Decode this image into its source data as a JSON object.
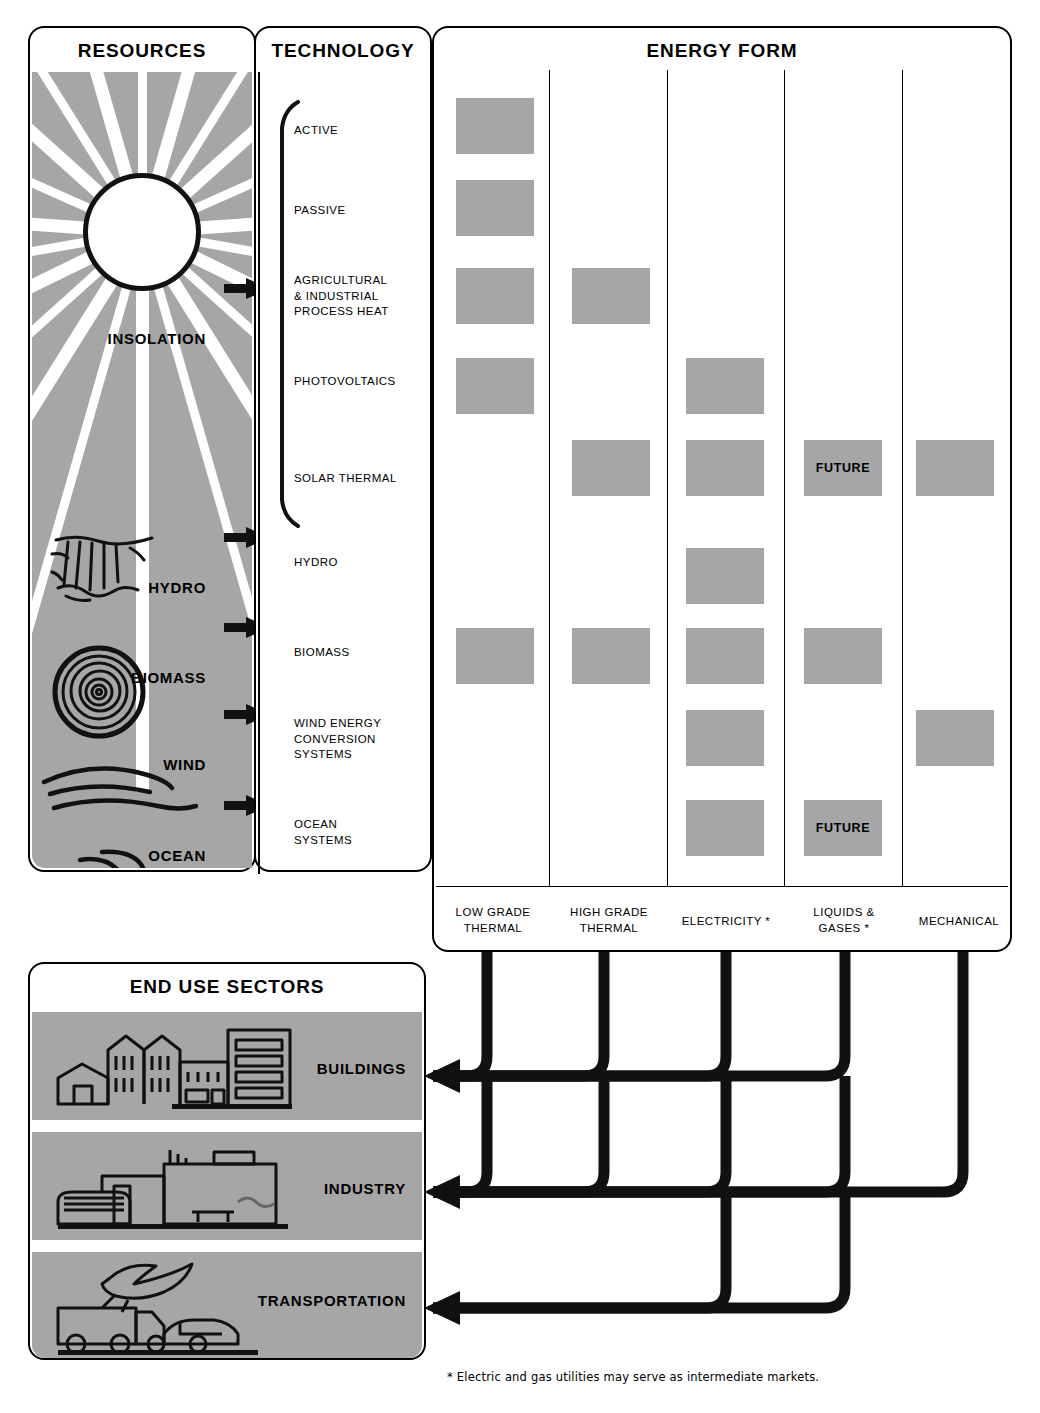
{
  "resources": {
    "title": "RESOURCES",
    "items": [
      {
        "label": "INSOLATION",
        "icon": "sun-icon"
      },
      {
        "label": "HYDRO",
        "icon": "waterfall-icon"
      },
      {
        "label": "BIOMASS",
        "icon": "log-cross-section-icon"
      },
      {
        "label": "WIND",
        "icon": "wind-lines-icon"
      },
      {
        "label": "OCEAN",
        "icon": "ocean-wave-icon"
      }
    ]
  },
  "technology": {
    "title": "TECHNOLOGY",
    "items": [
      {
        "label": "ACTIVE"
      },
      {
        "label": "PASSIVE"
      },
      {
        "label": "AGRICULTURAL\n& INDUSTRIAL\nPROCESS HEAT"
      },
      {
        "label": "PHOTOVOLTAICS"
      },
      {
        "label": "SOLAR THERMAL"
      },
      {
        "label": "HYDRO"
      },
      {
        "label": "BIOMASS"
      },
      {
        "label": "WIND ENERGY\nCONVERSION\nSYSTEMS"
      },
      {
        "label": "OCEAN\nSYSTEMS"
      }
    ]
  },
  "energy_form": {
    "title": "ENERGY FORM",
    "columns": [
      {
        "label": "LOW GRADE\nTHERMAL"
      },
      {
        "label": "HIGH GRADE\nTHERMAL"
      },
      {
        "label": "ELECTRICITY *"
      },
      {
        "label": "LIQUIDS &\nGASES *"
      },
      {
        "label": "MECHANICAL"
      }
    ],
    "future_label": "FUTURE",
    "matrix": [
      {
        "row": "ACTIVE",
        "cells": [
          1,
          0,
          0,
          0,
          0
        ]
      },
      {
        "row": "PASSIVE",
        "cells": [
          1,
          0,
          0,
          0,
          0
        ]
      },
      {
        "row": "AGRICULTURAL & INDUSTRIAL PROCESS HEAT",
        "cells": [
          1,
          1,
          0,
          0,
          0
        ]
      },
      {
        "row": "PHOTOVOLTAICS",
        "cells": [
          1,
          0,
          1,
          0,
          0
        ]
      },
      {
        "row": "SOLAR THERMAL",
        "cells": [
          0,
          1,
          1,
          2,
          1
        ]
      },
      {
        "row": "HYDRO",
        "cells": [
          0,
          0,
          1,
          0,
          0
        ]
      },
      {
        "row": "BIOMASS",
        "cells": [
          1,
          1,
          1,
          1,
          0
        ]
      },
      {
        "row": "WIND ENERGY CONVERSION SYSTEMS",
        "cells": [
          0,
          0,
          1,
          0,
          1
        ]
      },
      {
        "row": "OCEAN SYSTEMS",
        "cells": [
          0,
          0,
          1,
          2,
          0
        ]
      }
    ]
  },
  "end_use": {
    "title": "END USE SECTORS",
    "sectors": [
      {
        "label": "BUILDINGS",
        "icon": "buildings-icon"
      },
      {
        "label": "INDUSTRY",
        "icon": "factory-icon"
      },
      {
        "label": "TRANSPORTATION",
        "icon": "truck-car-plane-icon"
      }
    ]
  },
  "connections": [
    {
      "from": "LOW GRADE THERMAL",
      "to": [
        "BUILDINGS",
        "INDUSTRY"
      ]
    },
    {
      "from": "HIGH GRADE THERMAL",
      "to": [
        "BUILDINGS",
        "INDUSTRY"
      ]
    },
    {
      "from": "ELECTRICITY *",
      "to": [
        "BUILDINGS",
        "INDUSTRY",
        "TRANSPORTATION"
      ]
    },
    {
      "from": "LIQUIDS & GASES *",
      "to": [
        "BUILDINGS",
        "INDUSTRY",
        "TRANSPORTATION"
      ]
    },
    {
      "from": "MECHANICAL",
      "to": [
        "INDUSTRY"
      ]
    }
  ],
  "footnote": "* Electric and gas utilities may serve as intermediate markets.",
  "colors": {
    "gray_fill": "#a6a6a6",
    "line": "#000000",
    "background": "#ffffff"
  }
}
